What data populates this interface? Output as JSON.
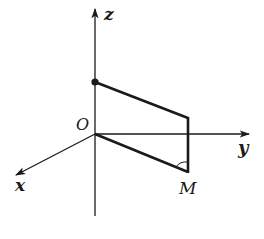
{
  "diagram": {
    "type": "3d-coordinate-axes",
    "labels": {
      "z_axis": "z",
      "y_axis": "y",
      "x_axis": "x",
      "origin": "O",
      "point_m": "M"
    },
    "colors": {
      "stroke": "#1a1a1a",
      "background": "#ffffff"
    },
    "elements": [
      "z-axis with arrow up",
      "y-axis with arrow right",
      "x-axis with arrow down-left",
      "point on z-axis (filled dot)",
      "quadrilateral from z-point through top-right corner down to M and back to O",
      "angle mark at M"
    ]
  }
}
